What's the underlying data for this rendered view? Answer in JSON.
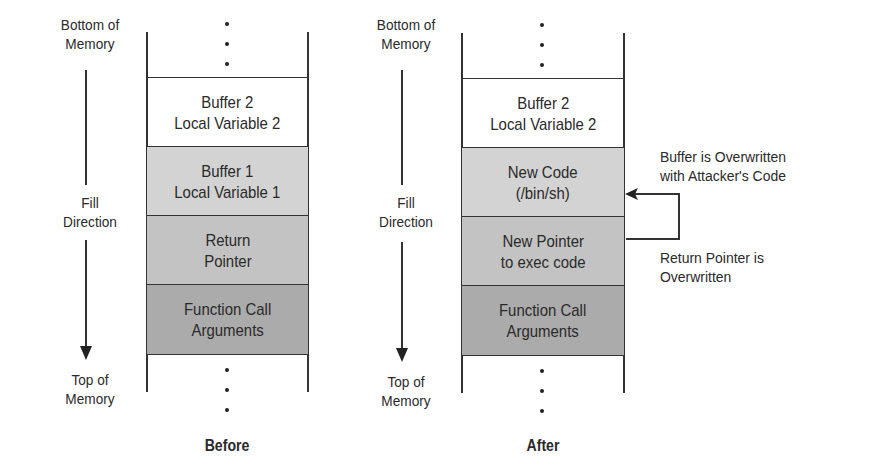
{
  "diagrams": {
    "before": {
      "caption": "Before",
      "side": {
        "bottom": "Bottom of\nMemory",
        "fill": "Fill\nDirection",
        "top": "Top of\nMemory"
      },
      "cells": [
        {
          "label": "Buffer 2\nLocal Variable 2",
          "shade": "none"
        },
        {
          "label": "Buffer 1\nLocal Variable 1",
          "shade": "light"
        },
        {
          "label": "Return\nPointer",
          "shade": "mid"
        },
        {
          "label": "Function Call\nArguments",
          "shade": "dark"
        }
      ]
    },
    "after": {
      "caption": "After",
      "side": {
        "bottom": "Bottom of\nMemory",
        "fill": "Fill\nDirection",
        "top": "Top of\nMemory"
      },
      "cells": [
        {
          "label": "Buffer 2\nLocal Variable 2",
          "shade": "none"
        },
        {
          "label": "New Code\n(/bin/sh)",
          "shade": "light"
        },
        {
          "label": "New Pointer\nto exec code",
          "shade": "mid"
        },
        {
          "label": "Function Call\nArguments",
          "shade": "dark"
        }
      ],
      "annotations": {
        "buffer_overwritten": "Buffer is Overwritten\nwith Attacker's Code",
        "pointer_overwritten": "Return Pointer is\nOverwritten"
      }
    }
  },
  "colors": {
    "light": "#d3d3d3",
    "mid": "#c3c3c3",
    "dark": "#ababab",
    "line": "#333333"
  }
}
